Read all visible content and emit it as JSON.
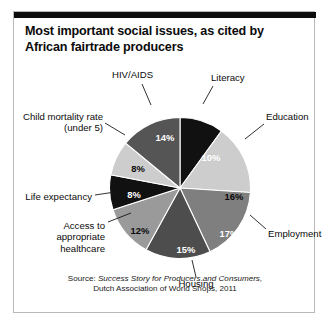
{
  "figure": {
    "title": "Most important social issues, as cited by African fairtrade producers",
    "source_prefix": "Source: ",
    "source_italic": "Success Story for Producers and Consumers,",
    "source_rest": "Dutch Association of World Shops, 2011"
  },
  "chart_data": {
    "type": "pie",
    "title": "Most important social issues, as cited by African fairtrade producers",
    "xlabel": "",
    "ylabel": "",
    "legend_position": "none",
    "grid": false,
    "units": "percent",
    "start_angle_deg": 0,
    "direction": "clockwise",
    "categories": [
      "Literacy",
      "Education",
      "Employment",
      "Housing",
      "Access to appropriate healthcare",
      "Life expectancy",
      "Child mortality rate (under 5)",
      "HIV/AIDS"
    ],
    "values": [
      10,
      16,
      17,
      15,
      12,
      8,
      8,
      14
    ],
    "value_labels": [
      "10%",
      "16%",
      "17%",
      "15%",
      "12%",
      "8%",
      "8%",
      "14%"
    ],
    "colors": [
      "#111111",
      "#cdcdcd",
      "#7f7f7f",
      "#4d4d4d",
      "#9a9a9a",
      "#111111",
      "#cdcdcd",
      "#555555"
    ],
    "slices": [
      {
        "label": "Literacy",
        "value": 10,
        "value_label": "10%",
        "color": "#111111",
        "label_text_color": "#ffffff",
        "callout_label_pos": {
          "x": 197,
          "y": 60,
          "align": "left"
        },
        "pct_pos": {
          "x": 197,
          "y": 145
        },
        "leader": {
          "x1": 199,
          "y1": 74,
          "x2": 189,
          "y2": 92
        }
      },
      {
        "label": "Education",
        "value": 16,
        "value_label": "16%",
        "color": "#cdcdcd",
        "label_text_color": "#0b0b0b",
        "callout_label_pos": {
          "x": 252,
          "y": 99,
          "align": "left"
        },
        "pct_pos": {
          "x": 220,
          "y": 184
        },
        "leader": {
          "x1": 250,
          "y1": 112,
          "x2": 231,
          "y2": 127
        }
      },
      {
        "label": "Employment",
        "value": 17,
        "value_label": "17%",
        "color": "#7f7f7f",
        "label_text_color": "#ffffff",
        "callout_label_pos": {
          "x": 254,
          "y": 216,
          "align": "left"
        },
        "pct_pos": {
          "x": 215,
          "y": 221
        },
        "leader": {
          "x1": 252,
          "y1": 217,
          "x2": 236,
          "y2": 203
        }
      },
      {
        "label": "Housing",
        "value": 15,
        "value_label": "15%",
        "color": "#4d4d4d",
        "label_text_color": "#ffffff",
        "callout_label_pos": {
          "x": 182,
          "y": 266,
          "align": "center"
        },
        "pct_pos": {
          "x": 172,
          "y": 237
        },
        "leader": {
          "x1": 182,
          "y1": 265,
          "x2": 178,
          "y2": 248
        }
      },
      {
        "label": "Access to appropriate healthcare",
        "value": 12,
        "value_label": "12%",
        "color": "#9a9a9a",
        "label_text_color": "#0b0b0b",
        "callout_label_pos": {
          "x": 91,
          "y": 208,
          "align": "right"
        },
        "pct_pos": {
          "x": 126,
          "y": 218
        },
        "leader": {
          "x1": 94,
          "y1": 210,
          "x2": 117,
          "y2": 201
        }
      },
      {
        "label": "Life expectancy",
        "value": 8,
        "value_label": "8%",
        "color": "#111111",
        "label_text_color": "#ffffff",
        "callout_label_pos": {
          "x": 78,
          "y": 179,
          "align": "right"
        },
        "pct_pos": {
          "x": 120,
          "y": 182
        },
        "leader": {
          "x1": 81,
          "y1": 183,
          "x2": 101,
          "y2": 180
        }
      },
      {
        "label": "Child mortality rate (under 5)",
        "value": 8,
        "value_label": "8%",
        "color": "#cdcdcd",
        "label_text_color": "#0b0b0b",
        "callout_label_pos": {
          "x": 89,
          "y": 99,
          "align": "right"
        },
        "pct_pos": {
          "x": 124,
          "y": 156
        },
        "leader": {
          "x1": 91,
          "y1": 111,
          "x2": 111,
          "y2": 123
        }
      },
      {
        "label": "HIV/AIDS",
        "value": 14,
        "value_label": "14%",
        "color": "#555555",
        "label_text_color": "#ffffff",
        "callout_label_pos": {
          "x": 98,
          "y": 57,
          "align": "left"
        },
        "pct_pos": {
          "x": 151,
          "y": 125
        },
        "leader": {
          "x1": 128,
          "y1": 72,
          "x2": 137,
          "y2": 93
        }
      }
    ]
  }
}
